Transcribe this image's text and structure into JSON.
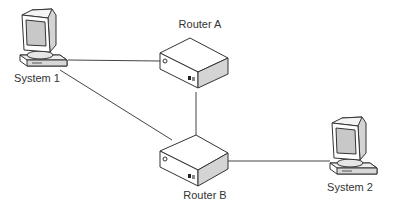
{
  "diagram": {
    "type": "network-topology",
    "colors": {
      "line": "#444444",
      "face_light": "#ffffff",
      "face_side": "#d4d4d4",
      "screen": "#c8c8c8",
      "text": "#333333"
    },
    "nodes": [
      {
        "id": "system1",
        "kind": "computer",
        "label": "System 1"
      },
      {
        "id": "routerA",
        "kind": "router",
        "label": "Router A"
      },
      {
        "id": "routerB",
        "kind": "router",
        "label": "Router B"
      },
      {
        "id": "system2",
        "kind": "computer",
        "label": "System 2"
      }
    ],
    "links": [
      {
        "from": "system1",
        "to": "routerA"
      },
      {
        "from": "system1",
        "to": "routerB"
      },
      {
        "from": "routerA",
        "to": "routerB"
      },
      {
        "from": "routerB",
        "to": "system2"
      }
    ]
  }
}
